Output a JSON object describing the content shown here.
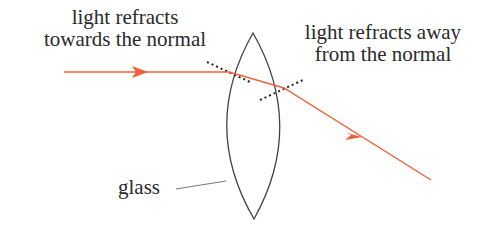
{
  "labels": {
    "toward_line1": "light refracts",
    "toward_line2": "towards the normal",
    "away_line1": "light refracts away",
    "away_line2": "from the normal",
    "glass": "glass"
  },
  "colors": {
    "ray": "#f0603a",
    "lens": "#444444",
    "normal": "#222222",
    "text": "#2a2a2a",
    "leader": "#777777"
  }
}
